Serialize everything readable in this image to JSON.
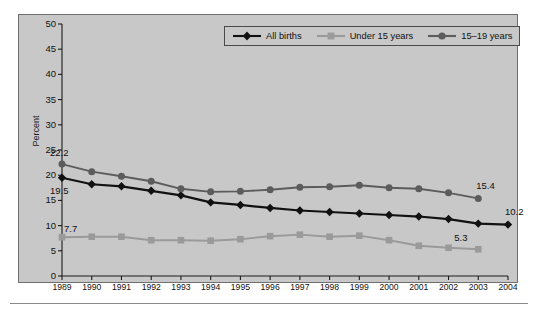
{
  "chart_data": {
    "type": "line",
    "title": "",
    "subtitle": "",
    "xlabel": "",
    "ylabel": "Percent",
    "xlim": [
      1989,
      2004
    ],
    "ylim": [
      0,
      50
    ],
    "ytick_step": 5,
    "grid": false,
    "legend_position": "top-right",
    "categories": [
      "1989",
      "1990",
      "1991",
      "1992",
      "1993",
      "1994",
      "1995",
      "1996",
      "1997",
      "1998",
      "1999",
      "2000",
      "2001",
      "2002",
      "2003",
      "2004"
    ],
    "x": [
      1989,
      1990,
      1991,
      1992,
      1993,
      1994,
      1995,
      1996,
      1997,
      1998,
      1999,
      2000,
      2001,
      2002,
      2003,
      2004
    ],
    "yticks": [
      0,
      5,
      10,
      15,
      20,
      25,
      30,
      35,
      40,
      45,
      50
    ],
    "ytick_labels": [
      "0",
      "5",
      "10",
      "15",
      "20",
      "25",
      "30",
      "35",
      "40",
      "45",
      "50"
    ],
    "series": [
      {
        "name": "All births",
        "color": "#111111",
        "marker": "diamond",
        "x": [
          1989,
          1990,
          1991,
          1992,
          1993,
          1994,
          1995,
          1996,
          1997,
          1998,
          1999,
          2000,
          2001,
          2002,
          2003,
          2004
        ],
        "values": [
          19.5,
          18.2,
          17.8,
          16.9,
          16.0,
          14.6,
          14.1,
          13.5,
          13.0,
          12.7,
          12.4,
          12.1,
          11.8,
          11.3,
          10.4,
          10.2
        ]
      },
      {
        "name": "Under 15 years",
        "color": "#9a9a9a",
        "marker": "square",
        "x": [
          1989,
          1990,
          1991,
          1992,
          1993,
          1994,
          1995,
          1996,
          1997,
          1998,
          1999,
          2000,
          2001,
          2002,
          2003
        ],
        "values": [
          7.7,
          7.8,
          7.8,
          7.1,
          7.1,
          7.0,
          7.3,
          7.9,
          8.2,
          7.8,
          8.0,
          7.1,
          6.0,
          5.6,
          5.3
        ]
      },
      {
        "name": "15–19 years",
        "color": "#5c5c5c",
        "marker": "circle",
        "x": [
          1989,
          1990,
          1991,
          1992,
          1993,
          1994,
          1995,
          1996,
          1997,
          1998,
          1999,
          2000,
          2001,
          2002,
          2003
        ],
        "values": [
          22.2,
          20.7,
          19.8,
          18.8,
          17.3,
          16.7,
          16.8,
          17.1,
          17.6,
          17.7,
          18.0,
          17.5,
          17.3,
          16.5,
          15.4
        ]
      }
    ],
    "annotations": [
      {
        "label": "22.2",
        "series": "15–19 years",
        "x": 1989,
        "y": 22.2
      },
      {
        "label": "19.5",
        "series": "All births",
        "x": 1989,
        "y": 19.5
      },
      {
        "label": "7.7",
        "series": "Under 15 years",
        "x": 1989,
        "y": 7.7
      },
      {
        "label": "15.4",
        "series": "15–19 years",
        "x": 2003,
        "y": 15.4
      },
      {
        "label": "10.2",
        "series": "All births",
        "x": 2004,
        "y": 10.2
      },
      {
        "label": "5.3",
        "series": "Under 15 years",
        "x": 2003,
        "y": 5.3
      }
    ]
  },
  "legend": {
    "items": [
      {
        "label": "All births",
        "color": "#111111",
        "marker": "diamond"
      },
      {
        "label": "Under 15 years",
        "color": "#9a9a9a",
        "marker": "square"
      },
      {
        "label": "15–19 years",
        "color": "#5c5c5c",
        "marker": "circle"
      }
    ]
  },
  "axis": {
    "y_title": "Percent"
  },
  "colors": {
    "plot_background": "#c8c8c8",
    "page_background": "#ffffff",
    "frame_border": "#6f6f6f",
    "axis": "#1a1a1a",
    "all_births": "#111111",
    "under_15": "#9a9a9a",
    "age_15_19": "#5c5c5c"
  }
}
